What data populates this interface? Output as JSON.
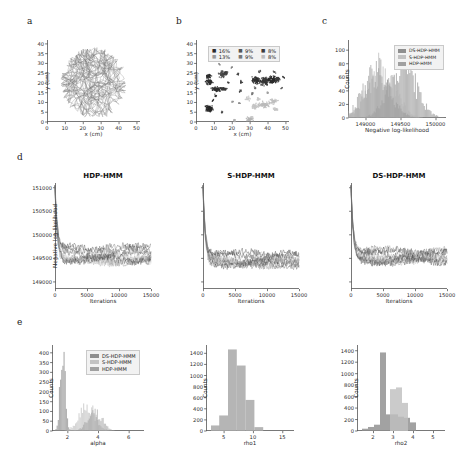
{
  "figure": {
    "panel_labels": [
      "a",
      "b",
      "c",
      "d",
      "e"
    ]
  },
  "chart_data": [
    {
      "id": "panel_a",
      "type": "line",
      "title": "",
      "xlabel": "x (cm)",
      "ylabel": "y (cm)",
      "xticks": [
        0,
        10,
        20,
        30,
        40,
        50
      ],
      "yticks": [
        0,
        5,
        10,
        15,
        20,
        25,
        30,
        35,
        40
      ],
      "xlim": [
        0,
        52
      ],
      "ylim": [
        0,
        42
      ],
      "grid": false,
      "legend": "none",
      "series": [
        {
          "name": "trajectory",
          "color": "#6e6e6e",
          "description": "dense 2D animal movement trajectory covering the arena"
        }
      ]
    },
    {
      "id": "panel_b",
      "type": "scatter",
      "title": "",
      "xlabel": "x (cm)",
      "ylabel": "y (cm)",
      "xticks": [
        0,
        10,
        20,
        30,
        40,
        50
      ],
      "yticks": [
        0,
        5,
        10,
        15,
        20,
        25,
        30,
        35,
        40
      ],
      "xlim": [
        0,
        52
      ],
      "ylim": [
        0,
        42
      ],
      "grid": false,
      "legend": "upper center",
      "legend_entries": [
        {
          "label": "16%",
          "color": "#2b2b2b"
        },
        {
          "label": "9%",
          "color": "#555555"
        },
        {
          "label": "8%",
          "color": "#3d3d3d"
        },
        {
          "label": "13%",
          "color": "#9a9a9a"
        },
        {
          "label": "9%",
          "color": "#777777"
        },
        {
          "label": "8%",
          "color": "#bdbdbd"
        }
      ]
    },
    {
      "id": "panel_c",
      "type": "bar",
      "title": "",
      "xlabel": "Negative log-likelihood",
      "ylabel": "Counts",
      "xticks": [
        149000,
        149500,
        150000
      ],
      "yticks": [
        0,
        20,
        40,
        60,
        80,
        100
      ],
      "xlim": [
        148750,
        150150
      ],
      "ylim": [
        0,
        115
      ],
      "grid": false,
      "legend": "upper right",
      "series": [
        {
          "name": "DS-HDP-HMM",
          "color": "#8f8f8f",
          "peak": 86,
          "center": 149530
        },
        {
          "name": "S-HDP-HMM",
          "color": "#b5b5b5",
          "peak": 80,
          "center": 149230
        },
        {
          "name": "HDP-HMM",
          "color": "#9c9c9c",
          "peak": 74,
          "center": 149150
        }
      ]
    },
    {
      "id": "panel_d1",
      "type": "line",
      "title": "HDP-HMM",
      "xlabel": "Iterations",
      "ylabel": "Negative log-likelihood",
      "xticks": [
        0,
        5000,
        10000,
        15000
      ],
      "yticks": [
        149000,
        149500,
        150000,
        150500,
        151000
      ],
      "xlim": [
        0,
        15000
      ],
      "ylim": [
        148850,
        151100
      ],
      "grid": false,
      "legend": "none",
      "n_chains": 10,
      "converged_level": 149550
    },
    {
      "id": "panel_d2",
      "type": "line",
      "title": "S-HDP-HMM",
      "xlabel": "Iterations",
      "ylabel": "",
      "xticks": [
        0,
        5000,
        10000,
        15000
      ],
      "yticks": [
        149000,
        149500,
        150000,
        150500,
        151000
      ],
      "xlim": [
        0,
        15000
      ],
      "ylim": [
        148850,
        151100
      ],
      "grid": false,
      "legend": "none",
      "n_chains": 10,
      "converged_level": 149480
    },
    {
      "id": "panel_d3",
      "type": "line",
      "title": "DS-HDP-HMM",
      "xlabel": "Iterations",
      "ylabel": "",
      "xticks": [
        0,
        5000,
        10000,
        15000
      ],
      "yticks": [
        149000,
        149500,
        150000,
        150500,
        151000
      ],
      "xlim": [
        0,
        15000
      ],
      "ylim": [
        148850,
        151100
      ],
      "grid": false,
      "legend": "none",
      "n_chains": 10,
      "converged_level": 149520
    },
    {
      "id": "panel_e1",
      "type": "bar",
      "title": "",
      "xlabel": "alpha",
      "ylabel": "Counts",
      "xticks": [
        2,
        4,
        6
      ],
      "yticks": [
        0,
        50,
        100,
        150,
        200,
        250,
        300,
        350,
        400
      ],
      "xlim": [
        1.0,
        7.0
      ],
      "ylim": [
        0,
        440
      ],
      "grid": false,
      "legend": "upper right",
      "series": [
        {
          "name": "DS-HDP-HMM",
          "color": "#8f8f8f",
          "peak": 420,
          "center": 1.7
        },
        {
          "name": "S-HDP-HMM",
          "color": "#bdbdbd",
          "peak": 130,
          "center": 3.3
        },
        {
          "name": "HDP-HMM",
          "color": "#a0a0a0",
          "peak": 110,
          "center": 3.8
        }
      ]
    },
    {
      "id": "panel_e2",
      "type": "bar",
      "title": "",
      "xlabel": "rho1",
      "ylabel": "Counts",
      "xticks": [
        5,
        10,
        15
      ],
      "yticks": [
        0,
        200,
        400,
        600,
        800,
        1000,
        1200,
        1400
      ],
      "xlim": [
        2.0,
        17.0
      ],
      "ylim": [
        0,
        1550
      ],
      "grid": false,
      "legend": "none",
      "bin_centers": [
        3.6,
        5.0,
        6.5,
        8.0,
        9.5,
        11.0
      ],
      "values": [
        100,
        280,
        1470,
        1180,
        560,
        70
      ],
      "color": "#a8a8a8"
    },
    {
      "id": "panel_e3",
      "type": "bar",
      "title": "",
      "xlabel": "rho2",
      "ylabel": "Counts",
      "xticks": [
        2,
        3,
        4,
        5
      ],
      "yticks": [
        0,
        200,
        400,
        600,
        800,
        1000,
        1200,
        1400
      ],
      "xlim": [
        1.2,
        5.6
      ],
      "ylim": [
        0,
        1500
      ],
      "grid": false,
      "legend": "none",
      "series": [
        {
          "name": "dark",
          "color": "#8d8d8d",
          "bin_centers": [
            1.6,
            1.9,
            2.2,
            2.5,
            2.8,
            3.1,
            3.4,
            3.7,
            4.0
          ],
          "values": [
            40,
            70,
            110,
            1370,
            290,
            290,
            250,
            230,
            150
          ]
        },
        {
          "name": "light",
          "color": "#bfbfbf",
          "bin_centers": [
            3.0,
            3.3,
            3.6
          ],
          "values": [
            730,
            760,
            490
          ]
        }
      ]
    }
  ],
  "legends": {
    "models": [
      {
        "label": "DS-HDP-HMM",
        "color": "#8f8f8f"
      },
      {
        "label": "S-HDP-HMM",
        "color": "#c2c2c2"
      },
      {
        "label": "HDP-HMM",
        "color": "#a0a0a0"
      }
    ]
  },
  "titles": {
    "d1": "HDP-HMM",
    "d2": "S-HDP-HMM",
    "d3": "DS-HDP-HMM"
  },
  "axis_labels": {
    "x_cm": "x (cm)",
    "y_cm": "y (cm)",
    "counts": "Counts",
    "neg_ll": "Negative log-likelihood",
    "iterations": "Iterations",
    "alpha": "alpha",
    "rho1": "rho1",
    "rho2": "rho2"
  }
}
